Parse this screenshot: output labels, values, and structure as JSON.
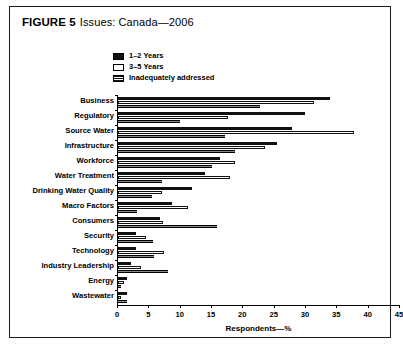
{
  "figure": {
    "label": "FIGURE 5",
    "caption": "Issues: Canada—2006"
  },
  "chart_data": {
    "type": "bar",
    "orientation": "horizontal",
    "title": "Issues: Canada—2006",
    "xlabel": "Respondents—%",
    "ylabel": "",
    "xlim": [
      0,
      45
    ],
    "xticks": [
      0,
      5,
      10,
      15,
      20,
      25,
      30,
      35,
      40,
      45
    ],
    "grid": false,
    "legend_position": "top-left",
    "categories": [
      "Business",
      "Regulatory",
      "Source Water",
      "Infrastructure",
      "Workforce",
      "Water Treatment",
      "Drinking Water Quality",
      "Macro Factors",
      "Consumers",
      "Security",
      "Technology",
      "Industry Leadership",
      "Energy",
      "Wastewater"
    ],
    "series": [
      {
        "name": "1–2 Years",
        "style": "solid-black",
        "color": "#111111",
        "values": [
          33.9,
          29.8,
          27.7,
          25.4,
          16.3,
          13.9,
          11.8,
          8.6,
          6.7,
          2.8,
          2.9,
          2.0,
          1.5,
          1.5
        ]
      },
      {
        "name": "3–5 Years",
        "style": "open-white",
        "color": "#ffffff",
        "values": [
          31.2,
          17.6,
          37.6,
          23.5,
          18.7,
          17.9,
          7.0,
          11.1,
          7.2,
          4.5,
          7.3,
          3.7,
          1.0,
          0.5
        ]
      },
      {
        "name": "Inadequately addressed",
        "style": "hatched",
        "color": "#222222",
        "values": [
          22.7,
          9.9,
          17.1,
          18.7,
          15.0,
          7.0,
          5.4,
          3.0,
          15.8,
          5.6,
          5.7,
          7.9,
          0.5,
          1.5
        ]
      }
    ]
  }
}
